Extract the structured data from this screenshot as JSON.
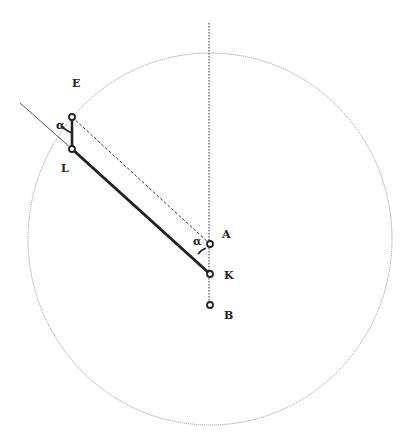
{
  "diagram": {
    "type": "geometric-construction",
    "circle": {
      "cx": 210,
      "cy": 239,
      "rx": 182,
      "ry": 186,
      "style": "thin-dotted"
    },
    "points": [
      {
        "id": "E",
        "label": "E",
        "x": 72,
        "y": 117
      },
      {
        "id": "L",
        "label": "L",
        "x": 72,
        "y": 149
      },
      {
        "id": "A",
        "label": "A",
        "x": 210,
        "y": 244
      },
      {
        "id": "K",
        "label": "K",
        "x": 210,
        "y": 274
      },
      {
        "id": "B",
        "label": "B",
        "x": 210,
        "y": 305
      }
    ],
    "angles": [
      {
        "label": "α",
        "at": "E"
      },
      {
        "label": "α",
        "at": "A"
      }
    ],
    "segments": [
      {
        "from": "L",
        "to": "K",
        "style": "thick-solid"
      },
      {
        "from": "E",
        "to": "L",
        "style": "thick-solid"
      },
      {
        "from": "E",
        "to": "A",
        "style": "dashed"
      },
      {
        "from": "vertical-axis-top",
        "to": "B",
        "style": "dotted"
      },
      {
        "from": "outer-ray",
        "to": "L",
        "style": "thin-solid"
      }
    ],
    "colors": {
      "ink": "#222222",
      "circle": "#888888"
    }
  }
}
